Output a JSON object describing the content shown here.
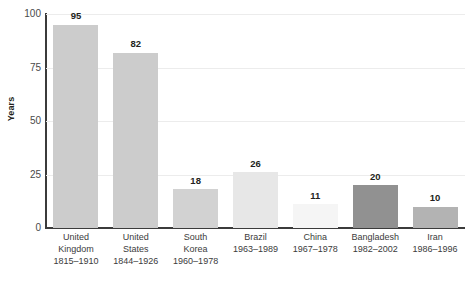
{
  "chart_data": {
    "type": "bar",
    "title": "",
    "subtitle": "",
    "xlabel": "",
    "ylabel": "Years",
    "ylim": [
      0,
      100
    ],
    "yticks": [
      "0",
      "25",
      "50",
      "75",
      "100"
    ],
    "ytick_values": [
      0,
      25,
      50,
      75,
      100
    ],
    "grid": true,
    "grid_axis": "y",
    "legend": false,
    "legend_position": "none",
    "categories": [
      "United Kingdom",
      "United States",
      "South Korea",
      "Brazil",
      "China",
      "Bangladesh",
      "Iran"
    ],
    "values": [
      95,
      82,
      18,
      26,
      11,
      20,
      10
    ],
    "bar_colors": [
      "#cccccc",
      "#cccccc",
      "#d2d2d2",
      "#e7e7e7",
      "#f5f5f5",
      "#919191",
      "#b3b3b3"
    ],
    "period_labels": [
      "1815–1910",
      "1844–1926",
      "1960–1978",
      "1963–1989",
      "1967–1978",
      "1982–2002",
      "1986–1996"
    ],
    "category_lines": [
      [
        "United",
        "Kingdom"
      ],
      [
        "United",
        "States"
      ],
      [
        "South",
        "Korea"
      ],
      [
        "Brazil"
      ],
      [
        "China"
      ],
      [
        "Bangladesh"
      ],
      [
        "Iran"
      ]
    ],
    "value_labels": [
      "95",
      "82",
      "18",
      "26",
      "11",
      "20",
      "10"
    ]
  },
  "colors": {
    "background": "#ffffff",
    "axis": "#3b3b3b",
    "gridline": "#ececec",
    "text": "#231f20",
    "tick_text": "#4a4a4a"
  }
}
